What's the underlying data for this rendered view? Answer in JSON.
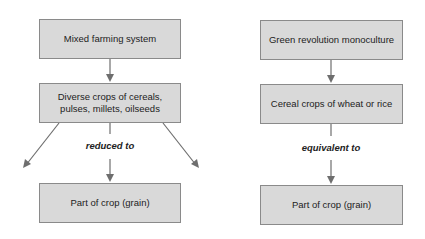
{
  "left_flow": {
    "top_box": "Mixed farming system",
    "middle_box": "Diverse crops of cereals, pulses, millets, oilseeds",
    "connector_label": "reduced to",
    "bottom_box": "Part of crop (grain)"
  },
  "right_flow": {
    "top_box": "Green revolution monoculture",
    "middle_box": "Cereal crops of wheat or rice",
    "connector_label": "equivalent to",
    "bottom_box": "Part of crop (grain)"
  },
  "colors": {
    "box_fill": "#d9d9d9",
    "box_border": "#8a8a8a",
    "arrow": "#6e6e6e"
  }
}
